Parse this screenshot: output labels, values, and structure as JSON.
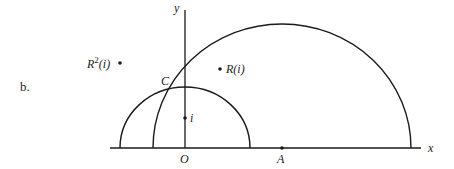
{
  "figure": {
    "part_label": "b.",
    "axes": {
      "x_label": "x",
      "y_label": "y",
      "origin_label": "O"
    },
    "points": {
      "A": "A",
      "C": "C",
      "i": "i",
      "R_i": "R(i)",
      "R2_i_base": "R",
      "R2_i_exp": "2",
      "R2_i_arg": "(i)"
    },
    "curves": [
      {
        "name": "small-semicircle",
        "center": "O",
        "description": "semicircle centered at O through i"
      },
      {
        "name": "large-semicircle",
        "center": "A",
        "description": "semicircle centered at A"
      }
    ]
  }
}
